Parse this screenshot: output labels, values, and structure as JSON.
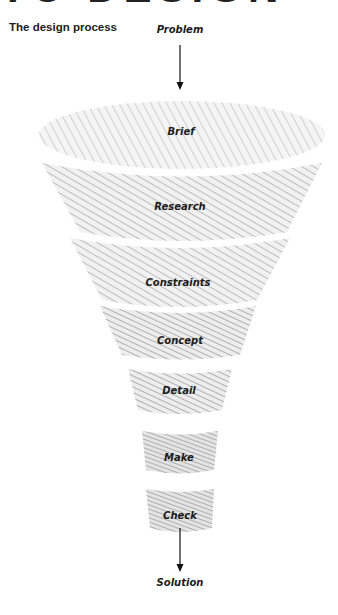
{
  "header": {
    "cropped_heading": "TO DESIGN",
    "title": "The design process"
  },
  "diagram": {
    "type": "funnel",
    "input_label": "Problem",
    "output_label": "Solution",
    "stages": [
      {
        "label": "Brief"
      },
      {
        "label": "Research"
      },
      {
        "label": "Constraints"
      },
      {
        "label": "Concept"
      },
      {
        "label": "Detail"
      },
      {
        "label": "Make"
      },
      {
        "label": "Check"
      }
    ],
    "colors": {
      "pencil_light": "#d6d6d6",
      "pencil_mid": "#b8b8b8",
      "pencil_dark": "#9a9a9a",
      "text": "#1c1c1c",
      "arrow": "#111111"
    }
  }
}
